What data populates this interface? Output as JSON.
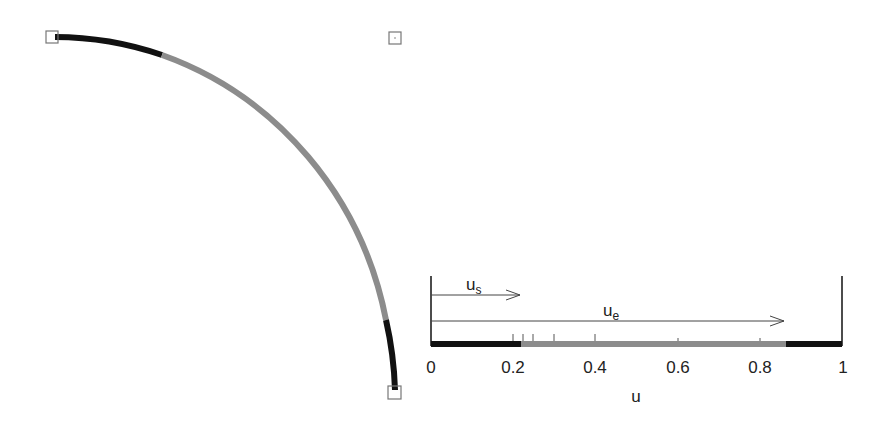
{
  "figure": {
    "arc": {
      "control_points": [
        {
          "name": "start-point",
          "x": 52,
          "y": 37
        },
        {
          "name": "middle-control-point",
          "x": 395,
          "y": 38
        },
        {
          "name": "end-point",
          "x": 395,
          "y": 391
        }
      ],
      "segments": [
        {
          "name": "black-start",
          "color": "#111111",
          "from_u": 0.0,
          "to_u": 0.22
        },
        {
          "name": "gray-middle",
          "color": "#8c8c8c",
          "from_u": 0.22,
          "to_u": 0.86
        },
        {
          "name": "black-end",
          "color": "#111111",
          "from_u": 0.86,
          "to_u": 1.0
        }
      ]
    },
    "axis": {
      "label": "u",
      "tick_labels": [
        "0",
        "0.2",
        "0.4",
        "0.6",
        "0.8",
        "1"
      ],
      "tick_values": [
        0,
        0.2,
        0.4,
        0.6,
        0.8,
        1
      ],
      "knot_ticks": [
        0.2,
        0.225,
        0.25,
        0.3,
        0.4,
        0.6,
        0.8
      ]
    },
    "arrows": {
      "us": {
        "label": "u",
        "subscript": "s",
        "value": 0.22
      },
      "ue": {
        "label": "u",
        "subscript": "e",
        "value": 0.86
      }
    },
    "colors": {
      "black": "#111111",
      "gray": "#8c8c8c",
      "box": "#777777"
    }
  }
}
